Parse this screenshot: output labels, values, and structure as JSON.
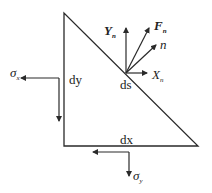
{
  "diagram": {
    "title": "",
    "shape": "right-triangle stress element",
    "labels": {
      "dy": "dy",
      "dx": "dx",
      "ds": "ds",
      "n": "n",
      "Yn_main": "Y",
      "Yn_sub": "n",
      "Fn_main": "F",
      "Fn_sub": "n",
      "Xn_main": "X",
      "Xn_sub": "n",
      "sigma_x_main": "σ",
      "sigma_x_sub": "x",
      "sigma_y_main": "σ",
      "sigma_y_sub": "y"
    },
    "colors": {
      "stroke": "#2a2a2a",
      "background": "#ffffff"
    }
  }
}
